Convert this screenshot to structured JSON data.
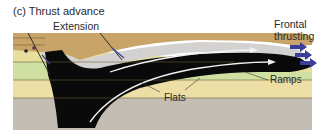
{
  "title": "(c) Thrust advance",
  "labels": {
    "extension": "Extension",
    "frontal_line1": "Frontal",
    "frontal_line2": "thrusting",
    "ramps": "Ramps",
    "flats": "Flats"
  },
  "colors": {
    "top_layer": "#c9a468",
    "light_gray_layer": "#d4d2d0",
    "yellow_layer": "#e7df9c",
    "green_layer": "#cfe0a2",
    "cream_layer": "#ecdea4",
    "base_gray": "#c3bdb3",
    "thrust_body": "#0a0a0a",
    "arrow_white": "#f2f2f2",
    "arrow_blue": "#3a3f9a",
    "boundary": "#6b5a3a"
  }
}
